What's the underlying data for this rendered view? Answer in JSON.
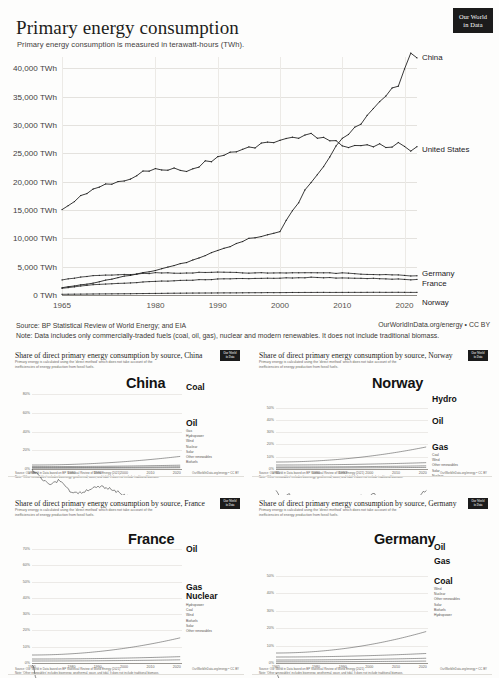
{
  "brand": {
    "logo_line1": "Our World",
    "logo_line2": "in Data",
    "logo_small_line1": "Our World",
    "logo_small_line2": "in Data"
  },
  "main": {
    "title": "Primary energy consumption",
    "subtitle": "Primary energy consumption is measured in terawatt-hours (TWh).",
    "source_note": "Source: BP Statistical Review of World Energy; and EIA",
    "data_note": "Note: Data includes only commercially-traded fuels (coal, oil, gas), nuclear and modern renewables. It does not include traditional biomass.",
    "credit": "OurWorldInData.org/energy • CC BY"
  },
  "chart_data": [
    {
      "id": "main",
      "type": "line",
      "title": "Primary energy consumption",
      "subtitle": "Primary energy consumption is measured in terawatt-hours (TWh).",
      "xlabel": "",
      "ylabel": "TWh",
      "ylim": [
        0,
        42000
      ],
      "xlim": [
        1965,
        2022
      ],
      "grid": true,
      "legend_position": "right-inline",
      "yticks": [
        "0 TWh",
        "5,000 TWh",
        "10,000 TWh",
        "15,000 TWh",
        "20,000 TWh",
        "25,000 TWh",
        "30,000 TWh",
        "35,000 TWh",
        "40,000 TWh"
      ],
      "ytick_values": [
        0,
        5000,
        10000,
        15000,
        20000,
        25000,
        30000,
        35000,
        40000
      ],
      "xticks": [
        "1965",
        "1980",
        "1990",
        "2000",
        "2010",
        "2020"
      ],
      "xtick_values": [
        1965,
        1980,
        1990,
        2000,
        2010,
        2020
      ],
      "x": [
        1965,
        1970,
        1975,
        1980,
        1985,
        1990,
        1995,
        2000,
        2005,
        2010,
        2015,
        2019,
        2021
      ],
      "series": [
        {
          "name": "China",
          "label": "China",
          "values": [
            1300,
            2100,
            3300,
            4300,
            5800,
            7800,
            9900,
            11300,
            20000,
            27500,
            32700,
            37500,
            42000
          ]
        },
        {
          "name": "United States",
          "label": "United States",
          "values": [
            15300,
            18700,
            20300,
            22500,
            22000,
            24200,
            25700,
            27600,
            28200,
            26500,
            26200,
            26500,
            25800
          ]
        },
        {
          "name": "Germany",
          "label": "Germany",
          "values": [
            2700,
            3400,
            3600,
            3900,
            3900,
            4000,
            3900,
            3950,
            3950,
            3850,
            3650,
            3500,
            3400
          ]
        },
        {
          "name": "France",
          "label": "France",
          "values": [
            1200,
            1800,
            2100,
            2400,
            2600,
            2800,
            2900,
            3000,
            3100,
            3000,
            2900,
            2800,
            2700
          ]
        },
        {
          "name": "Norway",
          "label": "Norway",
          "values": [
            120,
            180,
            220,
            280,
            330,
            360,
            400,
            430,
            450,
            460,
            470,
            470,
            460
          ]
        }
      ]
    },
    {
      "id": "china",
      "type": "line",
      "title": "Share of direct primary energy consumption by source, China",
      "subtitle": "Primary energy is calculated using the 'direct method' which does not take account of the inefficiencies of energy production from fossil fuels.",
      "country": "China",
      "ylim": [
        0,
        90
      ],
      "yticks": [
        "0%",
        "20%",
        "40%",
        "60%",
        "80%"
      ],
      "ytick_values": [
        0,
        20,
        40,
        60,
        80
      ],
      "xticks": [
        "1965",
        "1980",
        "1990",
        "2000",
        "2010",
        "2020"
      ],
      "xtick_values": [
        1965,
        1980,
        1990,
        2000,
        2010,
        2020
      ],
      "labels": [
        "Coal",
        "Oil"
      ],
      "legend": [
        "Gas",
        "Hydropower",
        "Wind",
        "Nuclear",
        "Solar",
        "Other renewables",
        "Biofuels"
      ],
      "source": "Source: Our World in Data based on BP Statistical Review of World Energy (2021)",
      "note": "Note: 'Other renewables' includes bioenergy, geothermal, wave, and tidal. It does not include traditional biomass.",
      "credit": "OurWorldInData.org/energy • CC BY"
    },
    {
      "id": "norway",
      "type": "line",
      "title": "Share of direct primary energy consumption by source, Norway",
      "subtitle": "Primary energy is calculated using the 'direct method' which does not take account of the inefficiencies of energy production from fossil fuels.",
      "country": "Norway",
      "ylim": [
        0,
        70
      ],
      "yticks": [
        "0%",
        "10%",
        "20%",
        "30%",
        "40%",
        "50%"
      ],
      "ytick_values": [
        0,
        10,
        20,
        30,
        40,
        50
      ],
      "xticks": [
        "1965",
        "1980",
        "1990",
        "2000",
        "2010",
        "2020"
      ],
      "xtick_values": [
        1965,
        1980,
        1990,
        2000,
        2010,
        2020
      ],
      "labels": [
        "Hydro",
        "Oil",
        "Gas"
      ],
      "legend": [
        "Coal",
        "Wind",
        "Other renewables",
        "Solar",
        "Nuclear"
      ],
      "source": "Source: Our World in Data based on BP Statistical Review of World Energy (2021)",
      "note": "Note: 'Other renewables' includes bioenergy, geothermal, wave, and tidal. It does not include traditional biomass.",
      "credit": "OurWorldInData.org/energy • CC BY"
    },
    {
      "id": "france",
      "type": "line",
      "title": "Share of direct primary energy consumption by source, France",
      "subtitle": "Primary energy is calculated using the 'direct method' which does not take account of the inefficiencies of energy production from fossil fuels.",
      "country": "France",
      "ylim": [
        0,
        75
      ],
      "yticks": [
        "0%",
        "10%",
        "20%",
        "30%",
        "40%",
        "50%",
        "60%",
        "70%"
      ],
      "ytick_values": [
        0,
        10,
        20,
        30,
        40,
        50,
        60,
        70
      ],
      "xticks": [
        "1965",
        "1980",
        "1990",
        "2000",
        "2010",
        "2020"
      ],
      "xtick_values": [
        1965,
        1980,
        1990,
        2000,
        2010,
        2020
      ],
      "labels": [
        "Oil",
        "Gas",
        "Nuclear"
      ],
      "legend": [
        "Hydropower",
        "Coal",
        "Wind",
        "Biofuels",
        "Solar",
        "Other renewables"
      ],
      "source": "Source: Our World in Data based on BP Statistical Review of World Energy (2021)",
      "note": "Note: 'Other renewables' includes bioenergy, geothermal, wave, and tidal. It does not include traditional biomass.",
      "credit": "OurWorldInData.org/energy • CC BY"
    },
    {
      "id": "germany",
      "type": "line",
      "title": "Share of direct primary energy consumption by source, Germany",
      "subtitle": "Primary energy is calculated using the 'direct method' which does not take account of the inefficiencies of energy production from fossil fuels.",
      "country": "Germany",
      "ylim": [
        0,
        70
      ],
      "yticks": [
        "0%",
        "10%",
        "20%",
        "30%",
        "40%",
        "50%"
      ],
      "ytick_values": [
        0,
        10,
        20,
        30,
        40,
        50
      ],
      "xticks": [
        "1965",
        "1980",
        "1990",
        "2000",
        "2010",
        "2020"
      ],
      "xtick_values": [
        1965,
        1980,
        1990,
        2000,
        2010,
        2020
      ],
      "labels": [
        "Oil",
        "Gas",
        "Coal"
      ],
      "legend": [
        "Wind",
        "Nuclear",
        "Other renewables",
        "Solar",
        "Biofuels",
        "Hydropower"
      ],
      "source": "Source: Our World in Data based on BP Statistical Review of World Energy (2021)",
      "note": "Note: 'Other renewables' includes bioenergy, geothermal, wave, and tidal. It does not include traditional biomass.",
      "credit": "OurWorldInData.org/energy • CC BY"
    }
  ]
}
